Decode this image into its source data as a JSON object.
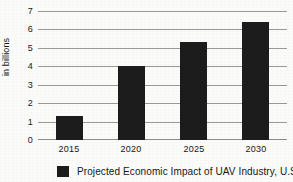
{
  "chart_data": {
    "type": "bar",
    "title": "",
    "subtitle": "",
    "xlabel": "",
    "ylabel": "in billions",
    "categories": [
      "2015",
      "2020",
      "2025",
      "2030"
    ],
    "values": [
      1.3,
      4.0,
      5.3,
      6.4
    ],
    "series": [
      {
        "name": "Projected Economic Impact of UAV Industry, U.S.",
        "values": [
          1.3,
          4.0,
          5.3,
          6.4
        ],
        "color": "#1c1c1c"
      }
    ],
    "ylim": [
      0,
      7
    ],
    "ytick_labels": [
      "0",
      "1",
      "2",
      "3",
      "4",
      "5",
      "6",
      "7"
    ],
    "ytick_values": [
      0,
      1,
      2,
      3,
      4,
      5,
      6,
      7
    ],
    "grid": "horizontal",
    "legend_position": "bottom",
    "legend_entries": [
      {
        "label": "Projected Economic Impact of UAV Industry, U.S.",
        "swatch_color": "#1c1c1c"
      }
    ],
    "annotations": [],
    "background_color": "#fbfbfa",
    "gridline_color": "#9a9a9a",
    "text_color": "#171717"
  },
  "axes": {
    "y": {
      "title": "in billions",
      "ticks": [
        {
          "label": "7",
          "value": 7
        },
        {
          "label": "6",
          "value": 6
        },
        {
          "label": "5",
          "value": 5
        },
        {
          "label": "4",
          "value": 4
        },
        {
          "label": "3",
          "value": 3
        },
        {
          "label": "2",
          "value": 2
        },
        {
          "label": "1",
          "value": 1
        },
        {
          "label": "0",
          "value": 0
        }
      ]
    },
    "x": {
      "title": "",
      "ticks": [
        {
          "label": "2015"
        },
        {
          "label": "2020"
        },
        {
          "label": "2025"
        },
        {
          "label": "2030"
        }
      ]
    }
  },
  "legend": {
    "swatch_name": "legend-color-swatch",
    "label": "Projected Economic Impact of UAV Industry, U.S."
  }
}
